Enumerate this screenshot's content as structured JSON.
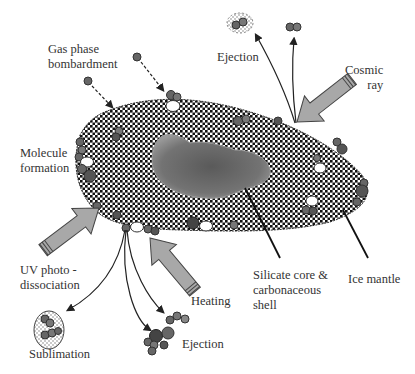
{
  "diagram": {
    "labels": {
      "gas_phase": "Gas phase\nbombardment",
      "ejection_top": "Ejection",
      "cosmic_ray": "Cosmic\nray",
      "molecule_formation": "Molecule\nformation",
      "uv": "UV photo -\ndissociation",
      "heating": "Heating",
      "sublimation": "Sublimation",
      "ejection_bottom": "Ejection",
      "core": "Silicate core &\ncarbonaceous\nshell",
      "ice_mantle": "Ice mantle"
    },
    "colors": {
      "molecule_dark": "#555555",
      "molecule_mid": "#777777",
      "arrow_fill": "#a8a8a8",
      "core": "#707070",
      "line": "#222222"
    }
  }
}
